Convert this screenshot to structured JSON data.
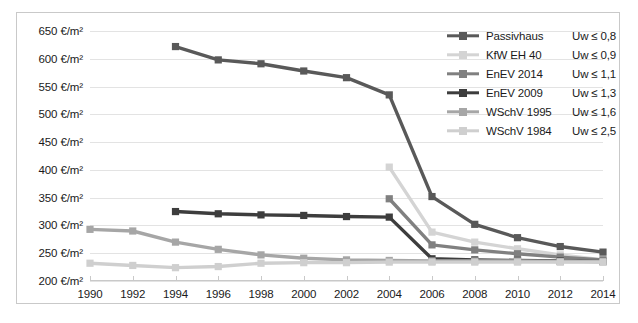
{
  "chart_data": {
    "type": "line",
    "title": "",
    "xlabel": "",
    "ylabel": "",
    "x": [
      1990,
      1992,
      1994,
      1996,
      1998,
      2000,
      2002,
      2004,
      2006,
      2008,
      2010,
      2012,
      2014
    ],
    "xtick_labels": [
      "1990",
      "1992",
      "1994",
      "1996",
      "1998",
      "2000",
      "2002",
      "2004",
      "2006",
      "2008",
      "2010",
      "2012",
      "2014"
    ],
    "ytick_labels": [
      "650 €/m²",
      "600 €/m²",
      "550 €/m²",
      "500 €/m²",
      "450 €/m²",
      "400 €/m²",
      "350 €/m²",
      "300 €/m²",
      "250 €/m²",
      "200 €/m²"
    ],
    "ytick_values": [
      650,
      600,
      550,
      500,
      450,
      400,
      350,
      300,
      250,
      200
    ],
    "ylim": [
      200,
      650
    ],
    "xlim": [
      1990,
      2014
    ],
    "grid": true,
    "legend_position": "top-right",
    "unit": "€/m²",
    "series": [
      {
        "name": "Passivhaus",
        "uw": "Uw ≤ 0,8",
        "color": "#595959",
        "x": [
          1994,
          1996,
          1998,
          2000,
          2002,
          2004,
          2006,
          2008,
          2010,
          2012,
          2014
        ],
        "values": [
          622,
          598,
          591,
          578,
          566,
          535,
          352,
          302,
          278,
          262,
          252
        ]
      },
      {
        "name": "KfW EH 40",
        "uw": "Uw ≤ 0,9",
        "color": "#d4d4d4",
        "x": [
          2004,
          2006,
          2008,
          2010,
          2012,
          2014
        ],
        "values": [
          405,
          288,
          270,
          258,
          247,
          238
        ]
      },
      {
        "name": "EnEV 2014",
        "uw": "Uw ≤ 1,1",
        "color": "#808080",
        "x": [
          2004,
          2006,
          2008,
          2010,
          2012,
          2014
        ],
        "values": [
          348,
          265,
          256,
          249,
          243,
          238
        ]
      },
      {
        "name": "EnEV 2009",
        "uw": "Uw ≤ 1,3",
        "color": "#3d3d3d",
        "x": [
          1994,
          1996,
          1998,
          2000,
          2002,
          2004,
          2006,
          2008,
          2010,
          2012,
          2014
        ],
        "values": [
          325,
          321,
          319,
          318,
          316,
          315,
          240,
          238,
          237,
          236,
          235
        ]
      },
      {
        "name": "WSchV 1995",
        "uw": "Uw ≤ 1,6",
        "color": "#a6a6a6",
        "x": [
          1990,
          1992,
          1994,
          1996,
          1998,
          2000,
          2002,
          2004,
          2006,
          2008,
          2010,
          2012,
          2014
        ],
        "values": [
          293,
          290,
          270,
          257,
          247,
          241,
          238,
          237,
          236,
          236,
          236,
          235,
          235
        ]
      },
      {
        "name": "WSchV 1984",
        "uw": "Uw ≤ 2,5",
        "color": "#cfcfcf",
        "x": [
          1990,
          1992,
          1994,
          1996,
          1998,
          2000,
          2002,
          2004,
          2006,
          2008,
          2010,
          2012,
          2014
        ],
        "values": [
          232,
          228,
          224,
          226,
          232,
          233,
          233,
          234,
          234,
          234,
          234,
          234,
          234
        ]
      }
    ]
  }
}
